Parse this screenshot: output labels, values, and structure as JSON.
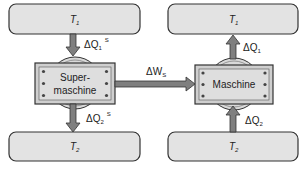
{
  "reservoirs": {
    "top_left": {
      "label": "T",
      "sub": "1"
    },
    "bottom_left": {
      "label": "T",
      "sub": "2"
    },
    "top_right": {
      "label": "T",
      "sub": "1"
    },
    "bottom_right": {
      "label": "T",
      "sub": "2"
    }
  },
  "machines": {
    "left": {
      "line1": "Super-",
      "line2": "maschine"
    },
    "right": {
      "line1": "Maschine"
    }
  },
  "flows": {
    "q1_super": {
      "delta": "ΔQ",
      "sub": "1",
      "sup": "S"
    },
    "q2_super": {
      "delta": "ΔQ",
      "sub": "2",
      "sup": "S"
    },
    "work": {
      "delta": "ΔW",
      "sub": "S"
    },
    "q1": {
      "delta": "ΔQ",
      "sub": "1"
    },
    "q2": {
      "delta": "ΔQ",
      "sub": "2"
    }
  },
  "colors": {
    "reservoir_fill": "#e3e3e3",
    "machine_fill": "#d4d4d4",
    "arrow_fill": "#7f7f7f",
    "stroke": "#333333"
  }
}
